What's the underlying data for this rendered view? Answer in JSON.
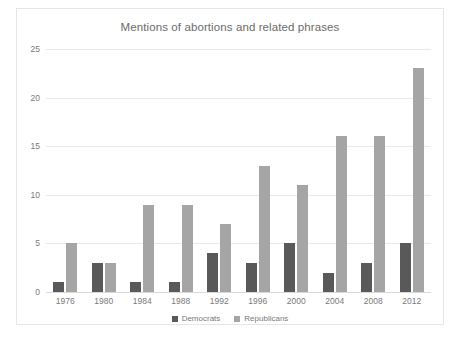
{
  "chart_data": {
    "type": "bar",
    "title": "Mentions of abortions and related phrases",
    "xlabel": "",
    "ylabel": "",
    "ylim": [
      0,
      25
    ],
    "yticks": [
      0,
      5,
      10,
      15,
      20,
      25
    ],
    "grid": true,
    "legend_position": "bottom",
    "categories": [
      "1976",
      "1980",
      "1984",
      "1988",
      "1992",
      "1996",
      "2000",
      "2004",
      "2008",
      "2012"
    ],
    "series": [
      {
        "name": "Democrats",
        "color": "#595959",
        "values": [
          1,
          3,
          1,
          1,
          4,
          3,
          5,
          2,
          3,
          5
        ]
      },
      {
        "name": "Republicans",
        "color": "#a5a5a5",
        "values": [
          5,
          3,
          9,
          9,
          7,
          13,
          11,
          16,
          16,
          23
        ]
      }
    ]
  }
}
